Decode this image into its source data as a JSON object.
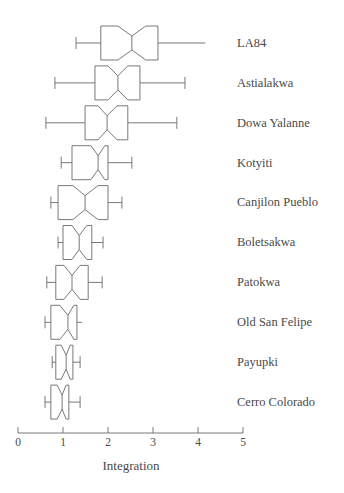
{
  "chart_data": {
    "type": "boxplot",
    "title": "",
    "subtitle": "",
    "xlabel": "Integration",
    "ylabel": "",
    "xlim": [
      0,
      5
    ],
    "xticks": [
      0,
      1,
      2,
      3,
      4,
      5
    ],
    "xticklabels": [
      "0",
      "1",
      "2",
      "3",
      "4",
      "5"
    ],
    "grid": false,
    "legend": null,
    "orientation": "horizontal",
    "notched": true,
    "categories": [
      "LA84",
      "Astialakwa",
      "Dowa Yalanne",
      "Kotyiti",
      "Canjilon Pueblo",
      "Boletsakwa",
      "Patokwa",
      "Old San Felipe",
      "Payupki",
      "Cerro Colorado"
    ],
    "boxes": [
      {
        "label": "LA84",
        "whisker_low": 1.29,
        "q1": 1.84,
        "median": 2.53,
        "q3": 3.11,
        "whisker_high": 4.16,
        "notch_low": 2.22,
        "notch_high": 2.84,
        "cap_low": true,
        "cap_high": false
      },
      {
        "label": "Astialakwa",
        "whisker_low": 0.82,
        "q1": 1.71,
        "median": 2.22,
        "q3": 2.71,
        "whisker_high": 3.71,
        "notch_low": 2.0,
        "notch_high": 2.44,
        "cap_low": true,
        "cap_high": true
      },
      {
        "label": "Dowa Yalanne",
        "whisker_low": 0.62,
        "q1": 1.49,
        "median": 1.98,
        "q3": 2.44,
        "whisker_high": 3.53,
        "notch_low": 1.78,
        "notch_high": 2.2,
        "cap_low": true,
        "cap_high": true
      },
      {
        "label": "Kotyiti",
        "whisker_low": 0.96,
        "q1": 1.2,
        "median": 1.78,
        "q3": 2.0,
        "whisker_high": 2.53,
        "notch_low": 1.62,
        "notch_high": 1.93,
        "cap_low": true,
        "cap_high": true
      },
      {
        "label": "Canjilon Pueblo",
        "whisker_low": 0.73,
        "q1": 0.89,
        "median": 1.49,
        "q3": 2.0,
        "whisker_high": 2.31,
        "notch_low": 1.22,
        "notch_high": 1.78,
        "cap_low": true,
        "cap_high": true
      },
      {
        "label": "Boletsakwa",
        "whisker_low": 0.89,
        "q1": 1.0,
        "median": 1.36,
        "q3": 1.64,
        "whisker_high": 1.89,
        "notch_low": 1.2,
        "notch_high": 1.53,
        "cap_low": true,
        "cap_high": true
      },
      {
        "label": "Patokwa",
        "whisker_low": 0.64,
        "q1": 0.84,
        "median": 1.2,
        "q3": 1.56,
        "whisker_high": 1.87,
        "notch_low": 1.02,
        "notch_high": 1.38,
        "cap_low": true,
        "cap_high": true
      },
      {
        "label": "Old San Felipe",
        "whisker_low": 0.6,
        "q1": 0.73,
        "median": 1.11,
        "q3": 1.31,
        "whisker_high": 1.42,
        "notch_low": 0.93,
        "notch_high": 1.24,
        "cap_low": true,
        "cap_high": false
      },
      {
        "label": "Payupki",
        "whisker_low": 0.76,
        "q1": 0.84,
        "median": 1.07,
        "q3": 1.22,
        "whisker_high": 1.38,
        "notch_low": 0.96,
        "notch_high": 1.16,
        "cap_low": true,
        "cap_high": true
      },
      {
        "label": "Cerro Colorado",
        "whisker_low": 0.6,
        "q1": 0.73,
        "median": 0.98,
        "q3": 1.13,
        "whisker_high": 1.38,
        "notch_low": 0.87,
        "notch_high": 1.07,
        "cap_low": true,
        "cap_high": true
      }
    ],
    "colors": {
      "line": "#6a6a6a",
      "text": "#4a4a4a",
      "background": "#ffffff"
    }
  }
}
